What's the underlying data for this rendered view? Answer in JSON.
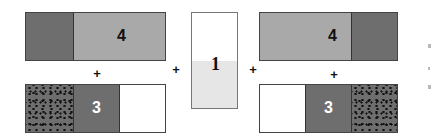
{
  "diagram": {
    "left_group": {
      "top_bar": {
        "label": "4",
        "segments": [
          "dark",
          "light"
        ]
      },
      "bottom_bar": {
        "label": "3",
        "segments": [
          "dotted",
          "dark",
          "white"
        ]
      },
      "operator": "+"
    },
    "operators": [
      "+",
      "+"
    ],
    "center_bar": {
      "label": "1",
      "segments": [
        "white",
        "light-gray"
      ]
    },
    "right_group": {
      "top_bar": {
        "label": "4",
        "segments": [
          "light",
          "dark"
        ]
      },
      "bottom_bar": {
        "label": "3",
        "segments": [
          "white",
          "dark",
          "dotted"
        ]
      },
      "operator": "+"
    },
    "colors": {
      "dark": "#6e6e6e",
      "light": "#a9a9a9",
      "center_light": "#e6e6e6",
      "white": "#ffffff",
      "border": "#444444"
    }
  }
}
